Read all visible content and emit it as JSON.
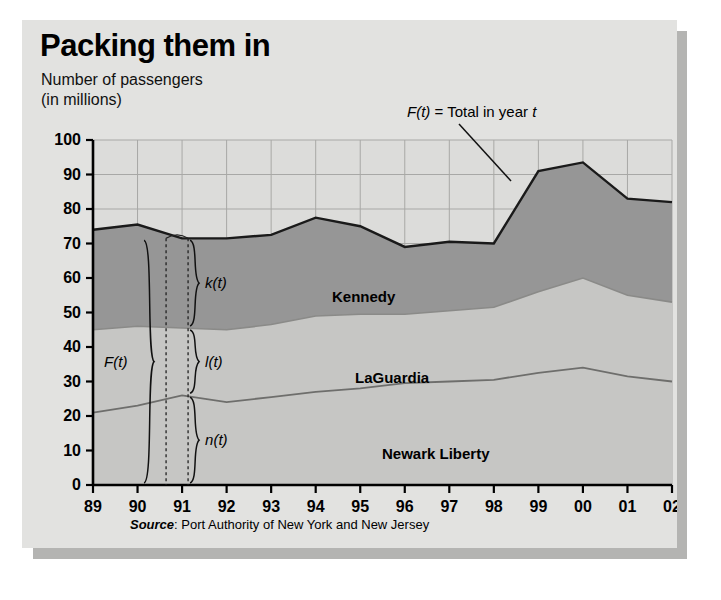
{
  "figure": {
    "title": "Packing them in",
    "subtitle_line1": "Number of passengers",
    "subtitle_line2": "(in millions)",
    "source_word": "Source",
    "source_rest": ": Port Authority of New York and New Jersey"
  },
  "annotations": {
    "total_note_f": "F(t)",
    "total_note_rest": " = Total in year ",
    "total_note_t": "t",
    "brace_total": "F(t)",
    "brace_kennedy": "k(t)",
    "brace_laguardia": "l(t)",
    "brace_newark": "n(t)"
  },
  "colors": {
    "panel_background": "#e2e2e0",
    "plot_background": "#dcdcda",
    "kennedy_band": "#969696",
    "laguardia_band": "#c6c6c4",
    "newark_band": "#c6c6c4",
    "line": "#1a1a1a",
    "grid": "#a8a8a6",
    "shadow": "#b4b4b2"
  },
  "chart_data": {
    "type": "area",
    "title": "Packing them in",
    "subtitle": "Number of passengers (in millions)",
    "xlabel": "",
    "ylabel": "Number of passengers (in millions)",
    "stacked": true,
    "grid": true,
    "legend": "inline-band-labels",
    "categories": [
      "89",
      "90",
      "91",
      "92",
      "93",
      "94",
      "95",
      "96",
      "97",
      "98",
      "99",
      "00",
      "01",
      "02"
    ],
    "xlim": [
      0,
      13
    ],
    "ylim": [
      0,
      100
    ],
    "yticks": [
      0,
      10,
      20,
      30,
      40,
      50,
      60,
      70,
      80,
      90,
      100
    ],
    "series": [
      {
        "name": "Newark Liberty",
        "symbol": "n(t)",
        "order": 1,
        "values": [
          21.0,
          23.0,
          26.0,
          24.0,
          25.5,
          27.0,
          28.0,
          29.5,
          30.0,
          30.5,
          32.5,
          34.0,
          31.5,
          30.0
        ]
      },
      {
        "name": "LaGuardia",
        "symbol": "l(t)",
        "order": 2,
        "values": [
          24.0,
          23.0,
          19.5,
          21.0,
          21.0,
          22.0,
          21.5,
          20.0,
          20.5,
          21.0,
          23.5,
          26.0,
          23.5,
          23.0
        ]
      },
      {
        "name": "Kennedy",
        "symbol": "k(t)",
        "order": 3,
        "values": [
          29.0,
          29.5,
          26.0,
          26.5,
          26.0,
          28.5,
          25.5,
          19.5,
          20.0,
          18.5,
          35.0,
          33.5,
          28.0,
          29.0
        ]
      }
    ],
    "total": {
      "name": "Total",
      "symbol": "F(t)",
      "values": [
        74.0,
        75.5,
        71.5,
        71.5,
        72.5,
        77.5,
        75.0,
        69.0,
        70.5,
        70.0,
        91.0,
        93.5,
        83.0,
        82.0
      ]
    },
    "boundaries": {
      "newark_top": [
        21.0,
        23.0,
        26.0,
        24.0,
        25.5,
        27.0,
        28.0,
        29.5,
        30.0,
        30.5,
        32.5,
        34.0,
        31.5,
        30.0
      ],
      "laguardia_top": [
        45.0,
        46.0,
        45.5,
        45.0,
        46.5,
        49.0,
        49.5,
        49.5,
        50.5,
        51.5,
        56.0,
        60.0,
        55.0,
        53.0
      ]
    }
  }
}
